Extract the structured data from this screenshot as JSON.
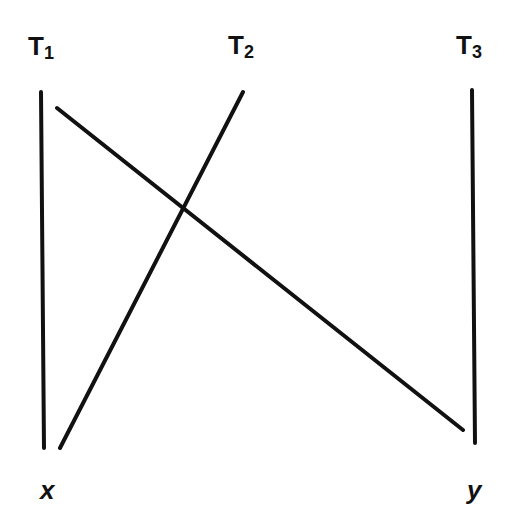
{
  "diagram": {
    "labels": {
      "t1": {
        "main": "T",
        "sub": "1"
      },
      "t2": {
        "main": "T",
        "sub": "2"
      },
      "t3": {
        "main": "T",
        "sub": "3"
      },
      "x": "x",
      "y": "y"
    },
    "lines": [
      {
        "id": "T1-axis",
        "x1": 41,
        "y1": 92,
        "x2": 44,
        "y2": 448
      },
      {
        "id": "T3-axis",
        "x1": 472,
        "y1": 90,
        "x2": 475,
        "y2": 443
      },
      {
        "id": "T1-to-y",
        "x1": 57,
        "y1": 108,
        "x2": 463,
        "y2": 430
      },
      {
        "id": "T2-to-x",
        "x1": 243,
        "y1": 92,
        "x2": 60,
        "y2": 448
      }
    ],
    "stroke_color": "#111111"
  }
}
